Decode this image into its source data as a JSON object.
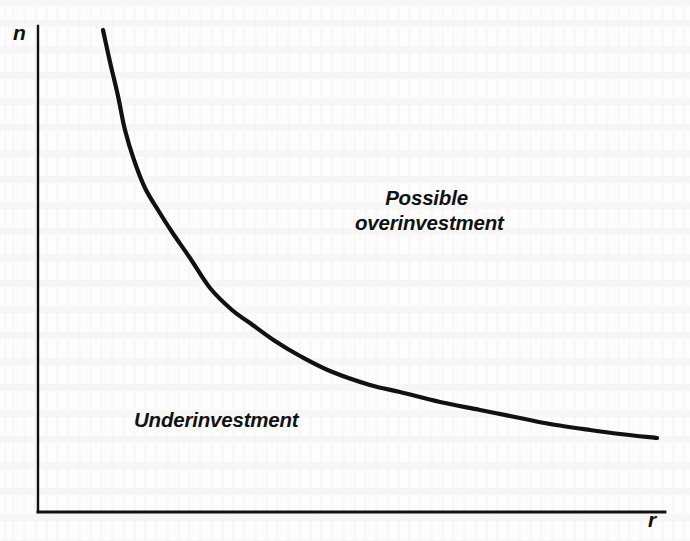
{
  "figure": {
    "background_color": "#fdfdfd",
    "ink_color": "#111111",
    "axes": {
      "y_axis_label": "n",
      "x_axis_label": "r",
      "y_axis_label_name": "n",
      "x_axis_label_name": "r",
      "origin_px": [
        38,
        512
      ],
      "y_axis_top_px": [
        38,
        26
      ],
      "x_axis_right_px": [
        665,
        512
      ],
      "axis_line_width_px": 2,
      "ticks": [],
      "tick_labels": [],
      "grid": false
    },
    "regions": {
      "above_curve_line1": "Possible",
      "above_curve_line2": "overinvestment",
      "below_curve": "Underinvestment"
    }
  },
  "chart_data": {
    "type": "line",
    "title": "",
    "subtitle": "",
    "xlabel": "r",
    "ylabel": "n",
    "grid": false,
    "legend": null,
    "xlim": [
      38,
      665
    ],
    "ylim": [
      512,
      26
    ],
    "axis_units": "pixels (unlabeled qualitative axes)",
    "annotations": [
      {
        "text": "Possible overinvestment",
        "position_px": [
          426,
          208
        ],
        "region": "above-curve",
        "style": "bold-italic"
      },
      {
        "text": "Underinvestment",
        "position_px": [
          212,
          428
        ],
        "region": "below-curve",
        "style": "bold-italic"
      }
    ],
    "series": [
      {
        "name": "boundary-curve",
        "description": "downward-sloping convex hyperbola separating underinvestment from possible overinvestment",
        "line_width_px": 4.2,
        "color": "#111111",
        "x": [
          103,
          110,
          118,
          125,
          134,
          145,
          158,
          172,
          190,
          210,
          232,
          250,
          275,
          300,
          330,
          370,
          400,
          440,
          480,
          520,
          550,
          590,
          620,
          657
        ],
        "y": [
          30,
          62,
          96,
          130,
          160,
          188,
          210,
          232,
          258,
          288,
          310,
          323,
          341,
          356,
          371,
          385,
          392,
          402,
          410,
          418,
          424,
          430,
          434,
          438
        ]
      }
    ]
  }
}
